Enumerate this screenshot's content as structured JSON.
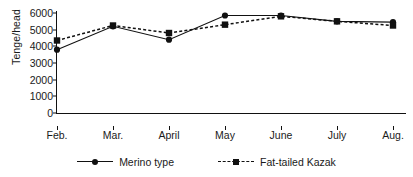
{
  "chart_data": {
    "type": "line",
    "title": "",
    "xlabel": "",
    "ylabel": "Tenge/head",
    "categories": [
      "Feb.",
      "Mar.",
      "April",
      "May",
      "June",
      "July",
      "Aug."
    ],
    "ylim": [
      0,
      6000
    ],
    "yticks": [
      0,
      1000,
      2000,
      3000,
      4000,
      5000,
      6000
    ],
    "ytick_labels": [
      "0",
      "1000",
      "2000",
      "3000",
      "4000",
      "5000",
      "6000"
    ],
    "grid": false,
    "legend_position": "bottom-center",
    "series": [
      {
        "name": "Merino type",
        "line_style": "solid",
        "marker": "circle",
        "color": "#111111",
        "values": [
          3800,
          5200,
          4400,
          5850,
          5850,
          5500,
          5450
        ]
      },
      {
        "name": "Fat-tailed Kazak",
        "line_style": "dashed",
        "marker": "square",
        "color": "#111111",
        "values": [
          4350,
          5250,
          4800,
          5300,
          5800,
          5500,
          5250
        ]
      }
    ]
  }
}
